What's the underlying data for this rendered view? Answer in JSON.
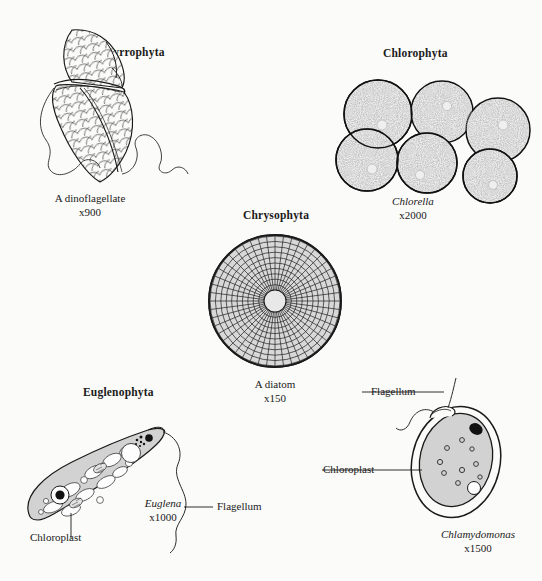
{
  "figure": {
    "title_hidden": "Representative algal divisions",
    "background_color": "#fbfbf9",
    "ink_color": "#1a1a1a"
  },
  "panels": [
    {
      "id": "pyrrophyta",
      "heading": "Pyrrophyta",
      "organism": "A dinoflagellate",
      "magnification": "x900",
      "organism_italic": false,
      "labels": []
    },
    {
      "id": "chlorophyta",
      "heading": "Chlorophyta",
      "organism": "Chlorella",
      "magnification": "x2000",
      "organism_italic": true,
      "cell_count": 6,
      "labels": []
    },
    {
      "id": "chrysophyta",
      "heading": "Chrysophyta",
      "organism": "A diatom",
      "magnification": "x150",
      "organism_italic": false,
      "rings": 10,
      "spokes": 48,
      "labels": []
    },
    {
      "id": "euglenophyta",
      "heading": "Euglenophyta",
      "organism": "Euglena",
      "magnification": "x1000",
      "organism_italic": true,
      "labels": [
        "Chloroplast",
        "Flagellum"
      ]
    },
    {
      "id": "chlamydomonas",
      "heading": "",
      "organism": "Chlamydomonas",
      "magnification": "x1500",
      "organism_italic": true,
      "labels": [
        "Flagellum",
        "Chloroplast"
      ]
    }
  ],
  "colors": {
    "cell_fill": "#d2d2d2",
    "diatom_fill": "#d8d8d8",
    "stipple_base": "#e4e4e4",
    "outline": "#1a1a1a",
    "organelle_white": "#fdfdfd",
    "eyespot": "#0d0d0d"
  }
}
